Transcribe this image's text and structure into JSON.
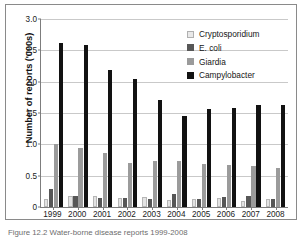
{
  "figure": {
    "caption": "Figure 12.2 Water-borne disease reports 1999-2008"
  },
  "chart_data": {
    "type": "bar",
    "title": "",
    "xlabel": "",
    "ylabel": "Number of reports ('000s)",
    "ylim": [
      0,
      3.0
    ],
    "yticks": [
      "0",
      "0.5",
      "1.0",
      "1.5",
      "2.0",
      "2.5",
      "3.0"
    ],
    "ytick_values": [
      0,
      0.5,
      1.0,
      1.5,
      2.0,
      2.5,
      3.0
    ],
    "grid": true,
    "legend_position": "top-right",
    "categories": [
      "1999",
      "2000",
      "2001",
      "2002",
      "2003",
      "2004",
      "2005",
      "2006",
      "2007",
      "2008"
    ],
    "series": [
      {
        "name": "Cryptosporidium",
        "color": "#e3e3e3",
        "values": [
          0.12,
          0.17,
          0.17,
          0.14,
          0.16,
          0.11,
          0.13,
          0.14,
          0.1,
          0.12
        ]
      },
      {
        "name": "E. coli",
        "color": "#575757",
        "values": [
          0.29,
          0.17,
          0.14,
          0.14,
          0.13,
          0.2,
          0.12,
          0.16,
          0.18,
          0.12
        ]
      },
      {
        "name": "Giardia",
        "color": "#9b9b9b",
        "values": [
          1.01,
          0.94,
          0.86,
          0.71,
          0.74,
          0.74,
          0.69,
          0.67,
          0.65,
          0.63
        ]
      },
      {
        "name": "Campylobacter",
        "color": "#121212",
        "values": [
          2.61,
          2.58,
          2.19,
          2.04,
          1.71,
          1.46,
          1.56,
          1.58,
          1.63,
          1.63
        ]
      }
    ]
  }
}
